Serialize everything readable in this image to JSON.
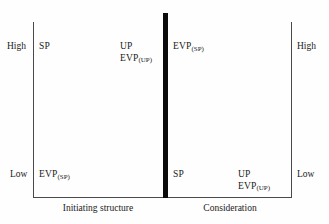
{
  "figure": {
    "background_color": "#fefefe",
    "line_color": "#4a4a4a",
    "divider_color": "#0b0b0b"
  },
  "scale_labels": {
    "high_left": "High",
    "low_left": "Low",
    "high_right": "High",
    "low_right": "Low"
  },
  "axis_captions": {
    "left": "Initiating structure",
    "right": "Consideration"
  },
  "cells": {
    "top_left": {
      "lines": [
        {
          "base": "SP",
          "sub": ""
        }
      ]
    },
    "top_mid": {
      "lines": [
        {
          "base": "UP",
          "sub": ""
        },
        {
          "base": "EVP",
          "sub": "(UP)"
        }
      ]
    },
    "top_right": {
      "lines": [
        {
          "base": "EVP",
          "sub": "(SP)"
        }
      ]
    },
    "bottom_left": {
      "lines": [
        {
          "base": "EVP",
          "sub": "(SP)"
        }
      ]
    },
    "bottom_mid": {
      "lines": [
        {
          "base": "SP",
          "sub": ""
        }
      ]
    },
    "bottom_right": {
      "lines": [
        {
          "base": "UP",
          "sub": ""
        },
        {
          "base": "EVP",
          "sub": "(UP)"
        }
      ]
    }
  }
}
